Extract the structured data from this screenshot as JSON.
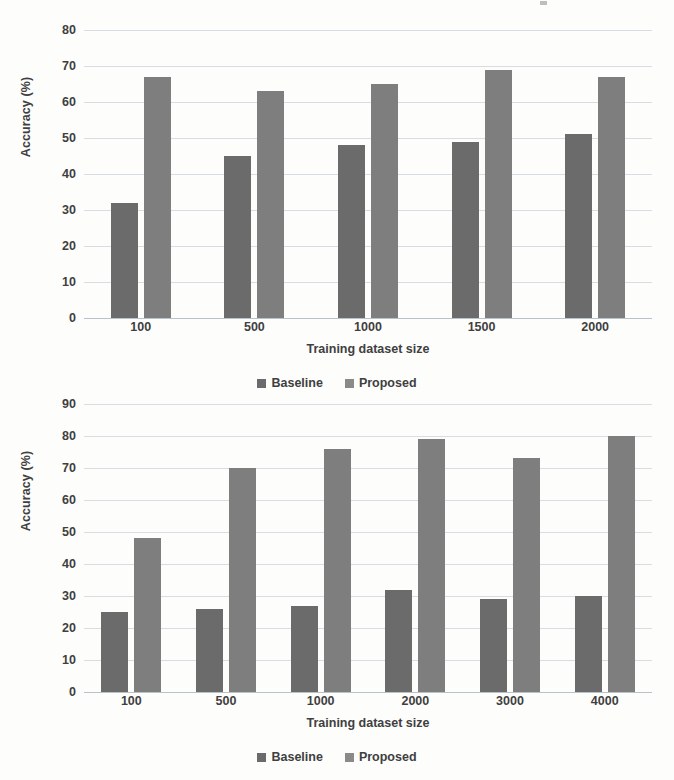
{
  "page": {
    "background_color": "#fdfdfc",
    "baseline_color": "#6b6b6b",
    "proposed_color": "#7e7e7e"
  },
  "charts": [
    {
      "id": "top-chart",
      "ylabel": "Accuracy (%)",
      "xlabel": "Training dataset size",
      "yticks": [
        "80",
        "70",
        "60",
        "50",
        "40",
        "30",
        "20",
        "10",
        "0"
      ],
      "xticks": [
        "100",
        "500",
        "1000",
        "1500",
        "2000"
      ],
      "legend": [
        {
          "label": "Baseline",
          "color": "#6b6b6b"
        },
        {
          "label": "Proposed",
          "color": "#8a8a8a"
        }
      ]
    },
    {
      "id": "bottom-chart",
      "ylabel": "Accuracy (%)",
      "xlabel": "Training dataset size",
      "yticks": [
        "90",
        "80",
        "70",
        "60",
        "50",
        "40",
        "30",
        "20",
        "10",
        "0"
      ],
      "xticks": [
        "100",
        "500",
        "1000",
        "2000",
        "3000",
        "4000"
      ],
      "legend": [
        {
          "label": "Baseline",
          "color": "#6b6b6b"
        },
        {
          "label": "Proposed",
          "color": "#8a8a8a"
        }
      ]
    }
  ],
  "chart_data": [
    {
      "type": "bar",
      "title": "",
      "xlabel": "Training dataset size",
      "ylabel": "Accuracy (%)",
      "categories": [
        "100",
        "500",
        "1000",
        "1500",
        "2000"
      ],
      "series": [
        {
          "name": "Baseline",
          "values": [
            32,
            45,
            48,
            49,
            51
          ],
          "color": "#6b6b6b"
        },
        {
          "name": "Proposed",
          "values": [
            67,
            63,
            65,
            69,
            67
          ],
          "color": "#7e7e7e"
        }
      ],
      "ylim": [
        0,
        80
      ],
      "ytick_step": 10,
      "grid": "horizontal",
      "legend_position": "bottom"
    },
    {
      "type": "bar",
      "title": "",
      "xlabel": "Training dataset size",
      "ylabel": "Accuracy (%)",
      "categories": [
        "100",
        "500",
        "1000",
        "2000",
        "3000",
        "4000"
      ],
      "series": [
        {
          "name": "Baseline",
          "values": [
            25,
            26,
            27,
            32,
            29,
            30
          ],
          "color": "#6b6b6b"
        },
        {
          "name": "Proposed",
          "values": [
            48,
            70,
            76,
            79,
            73,
            80
          ],
          "color": "#7e7e7e"
        }
      ],
      "ylim": [
        0,
        90
      ],
      "ytick_step": 10,
      "grid": "horizontal",
      "legend_position": "bottom"
    }
  ]
}
